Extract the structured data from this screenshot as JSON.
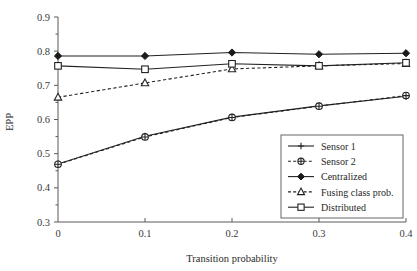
{
  "chart_data": {
    "type": "line",
    "title": "",
    "xlabel": "Transition probability",
    "ylabel": "EPP",
    "x": [
      0,
      0.1,
      0.2,
      0.3,
      0.4
    ],
    "xtick_labels": [
      "0",
      "0.1",
      "0.2",
      "0.3",
      "0.4"
    ],
    "ytick_labels": [
      "0.3",
      "0.4",
      "0.5",
      "0.6",
      "0.7",
      "0.8",
      "0.9"
    ],
    "ytick_values": [
      0.3,
      0.4,
      0.5,
      0.6,
      0.7,
      0.8,
      0.9
    ],
    "yminor_values": [
      0.35,
      0.45,
      0.55,
      0.65,
      0.75,
      0.85
    ],
    "xlim": [
      0,
      0.4
    ],
    "ylim": [
      0.3,
      0.9
    ],
    "grid": false,
    "legend_position": "lower right",
    "series": [
      {
        "name": "Sensor 1",
        "values": [
          0.47,
          0.551,
          0.607,
          0.64,
          0.668
        ],
        "line_style": "solid",
        "marker": "plus",
        "color": "#222222"
      },
      {
        "name": "Sensor 2",
        "values": [
          0.469,
          0.549,
          0.606,
          0.639,
          0.67
        ],
        "line_style": "dashed",
        "marker": "circle-plus",
        "color": "#222222"
      },
      {
        "name": "Centralized",
        "values": [
          0.786,
          0.786,
          0.796,
          0.791,
          0.794
        ],
        "line_style": "solid",
        "marker": "diamond-filled",
        "color": "#1a1a1a"
      },
      {
        "name": "Fusing class prob.",
        "values": [
          0.665,
          0.707,
          0.748,
          0.757,
          0.764
        ],
        "line_style": "dashed",
        "marker": "triangle-open",
        "color": "#222222"
      },
      {
        "name": "Distributed",
        "values": [
          0.757,
          0.747,
          0.763,
          0.757,
          0.766
        ],
        "line_style": "solid",
        "marker": "square-open",
        "color": "#222222"
      }
    ],
    "legend_entries": [
      {
        "label": "Sensor 1",
        "line_style": "solid",
        "marker": "plus"
      },
      {
        "label": "Sensor 2",
        "line_style": "dashed",
        "marker": "circle-plus"
      },
      {
        "label": "Centralized",
        "line_style": "solid",
        "marker": "diamond-filled"
      },
      {
        "label": "Fusing class prob.",
        "line_style": "dashed",
        "marker": "triangle-open"
      },
      {
        "label": "Distributed",
        "line_style": "solid",
        "marker": "square-open"
      }
    ],
    "colors": {
      "axis": "#5a5a5a",
      "data": "#222222",
      "background": "#ffffff",
      "legend_border": "#555555"
    }
  }
}
